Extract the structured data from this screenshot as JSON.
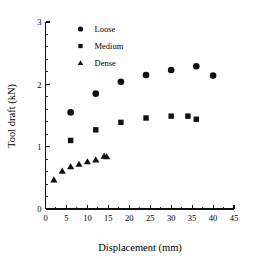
{
  "chart_data": {
    "type": "scatter",
    "title": "",
    "xlabel": "Displacement (mm)",
    "ylabel": "Tool draft (kN)",
    "xlim": [
      0,
      45
    ],
    "ylim": [
      0,
      3
    ],
    "xticks": [
      0,
      5,
      10,
      15,
      20,
      25,
      30,
      35,
      40,
      45
    ],
    "yticks": [
      0,
      1,
      2,
      3
    ],
    "xtick_labels": [
      "0",
      "5",
      "10",
      "15",
      "20",
      "25",
      "30",
      "35",
      "40",
      "45"
    ],
    "ytick_labels": [
      "0",
      "1",
      "2",
      "3"
    ],
    "x_minor_interval": 2.5,
    "y_minor_interval": 0.2,
    "grid": false,
    "legend_position": "top-left-inside",
    "marker_color": "#111111",
    "background_color": "#ffffff",
    "axis_color": "#111111",
    "series": [
      {
        "name": "Loose",
        "marker": "circle",
        "points": [
          {
            "x": 6.0,
            "y": 1.55
          },
          {
            "x": 12.0,
            "y": 1.85
          },
          {
            "x": 18.0,
            "y": 2.04
          },
          {
            "x": 24.0,
            "y": 2.15
          },
          {
            "x": 30.0,
            "y": 2.23
          },
          {
            "x": 36.0,
            "y": 2.29
          },
          {
            "x": 40.0,
            "y": 2.14
          }
        ]
      },
      {
        "name": "Medium",
        "marker": "square",
        "points": [
          {
            "x": 6.0,
            "y": 1.1
          },
          {
            "x": 12.0,
            "y": 1.27
          },
          {
            "x": 18.0,
            "y": 1.39
          },
          {
            "x": 24.0,
            "y": 1.46
          },
          {
            "x": 30.0,
            "y": 1.49
          },
          {
            "x": 34.0,
            "y": 1.49
          },
          {
            "x": 36.0,
            "y": 1.44
          }
        ]
      },
      {
        "name": "Dense",
        "marker": "triangle",
        "points": [
          {
            "x": 2.0,
            "y": 0.47
          },
          {
            "x": 4.0,
            "y": 0.61
          },
          {
            "x": 6.0,
            "y": 0.68
          },
          {
            "x": 8.0,
            "y": 0.72
          },
          {
            "x": 10.0,
            "y": 0.76
          },
          {
            "x": 12.0,
            "y": 0.79
          },
          {
            "x": 14.0,
            "y": 0.85
          },
          {
            "x": 14.6,
            "y": 0.84
          }
        ]
      }
    ]
  },
  "legend": {
    "entries": [
      {
        "label": "Loose",
        "marker": "circle"
      },
      {
        "label": "Medium",
        "marker": "square"
      },
      {
        "label": "Dense",
        "marker": "triangle"
      }
    ]
  }
}
